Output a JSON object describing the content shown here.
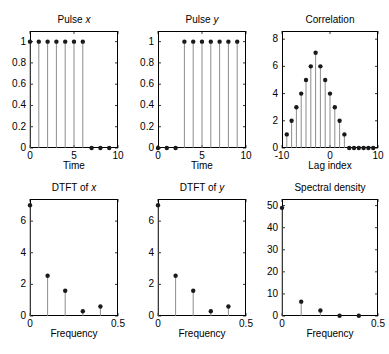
{
  "figure": {
    "background": "#ffffff",
    "stem_color": "#808080",
    "marker_color": "#1a1a1a",
    "axis_color": "#000000",
    "width": 389,
    "height": 354
  },
  "panels": [
    {
      "name": "pulse-x",
      "title_main": "Pulse ",
      "title_italic": "x",
      "xlabel": "Time"
    },
    {
      "name": "pulse-y",
      "title_main": "Pulse ",
      "title_italic": "y",
      "xlabel": "Time"
    },
    {
      "name": "correlation",
      "title_main": "Correlation",
      "title_italic": "",
      "xlabel": "Lag index"
    },
    {
      "name": "dtft-x",
      "title_main": "DTFT of ",
      "title_italic": "x",
      "xlabel": "Frequency"
    },
    {
      "name": "dtft-y",
      "title_main": "DTFT of ",
      "title_italic": "y",
      "xlabel": "Frequency"
    },
    {
      "name": "spectral-density",
      "title_main": "Spectral density",
      "title_italic": "",
      "xlabel": "Frequency"
    }
  ],
  "chart_data": [
    {
      "type": "stem",
      "name": "pulse-x",
      "title": "Pulse x",
      "xlabel": "Time",
      "ylabel": "",
      "xlim": [
        0,
        10
      ],
      "ylim": [
        0,
        1.1
      ],
      "xticks": [
        0,
        5,
        10
      ],
      "xticklabels": [
        "0",
        "5",
        "10"
      ],
      "yticks": [
        0,
        0.2,
        0.4,
        0.6,
        0.8,
        1
      ],
      "yticklabels": [
        "0",
        "0.2",
        "0.4",
        "0.6",
        "0.8",
        "1"
      ],
      "grid": false,
      "legend": "none",
      "x": [
        0,
        1,
        2,
        3,
        4,
        5,
        6,
        7,
        8,
        9
      ],
      "values": [
        1,
        1,
        1,
        1,
        1,
        1,
        1,
        0,
        0,
        0
      ]
    },
    {
      "type": "stem",
      "name": "pulse-y",
      "title": "Pulse y",
      "xlabel": "Time",
      "ylabel": "",
      "xlim": [
        0,
        10
      ],
      "ylim": [
        0,
        1.1
      ],
      "xticks": [
        0,
        5,
        10
      ],
      "xticklabels": [
        "0",
        "5",
        "10"
      ],
      "yticks": [
        0,
        0.2,
        0.4,
        0.6,
        0.8,
        1
      ],
      "yticklabels": [
        "0",
        "0.2",
        "0.4",
        "0.6",
        "0.8",
        "1"
      ],
      "grid": false,
      "legend": "none",
      "x": [
        0,
        1,
        2,
        3,
        4,
        5,
        6,
        7,
        8,
        9
      ],
      "values": [
        0,
        0,
        0,
        1,
        1,
        1,
        1,
        1,
        1,
        1
      ]
    },
    {
      "type": "stem",
      "name": "correlation",
      "title": "Correlation",
      "xlabel": "Lag index",
      "ylabel": "",
      "xlim": [
        -10,
        10
      ],
      "ylim": [
        0,
        8.6
      ],
      "xticks": [
        -10,
        0,
        10
      ],
      "xticklabels": [
        "-10",
        "0",
        "10"
      ],
      "yticks": [
        0,
        2,
        4,
        6,
        8
      ],
      "yticklabels": [
        "0",
        "2",
        "4",
        "6",
        "8"
      ],
      "grid": false,
      "legend": "none",
      "x": [
        -9,
        -8,
        -7,
        -6,
        -5,
        -4,
        -3,
        -2,
        -1,
        0,
        1,
        2,
        3,
        4,
        5,
        6,
        7,
        8,
        9
      ],
      "values": [
        1,
        2,
        3,
        4,
        5,
        6,
        7,
        6,
        5,
        4,
        3,
        2,
        1,
        0,
        0,
        0,
        0,
        0,
        0
      ]
    },
    {
      "type": "stem",
      "name": "dtft-x",
      "title": "DTFT of x",
      "xlabel": "Frequency",
      "ylabel": "",
      "xlim": [
        0,
        0.5
      ],
      "ylim": [
        0,
        7.4
      ],
      "xticks": [
        0,
        0.5
      ],
      "xticklabels": [
        "0",
        "0.5"
      ],
      "yticks": [
        0,
        2,
        4,
        6
      ],
      "yticklabels": [
        "0",
        "2",
        "4",
        "6"
      ],
      "grid": false,
      "legend": "none",
      "x": [
        0,
        0.1,
        0.2,
        0.3,
        0.4
      ],
      "values": [
        7,
        2.55,
        1.6,
        0.3,
        0.6
      ]
    },
    {
      "type": "stem",
      "name": "dtft-y",
      "title": "DTFT of y",
      "xlabel": "Frequency",
      "ylabel": "",
      "xlim": [
        0,
        0.5
      ],
      "ylim": [
        0,
        7.4
      ],
      "xticks": [
        0,
        0.5
      ],
      "xticklabels": [
        "0",
        "0.5"
      ],
      "yticks": [
        0,
        2,
        4,
        6
      ],
      "yticklabels": [
        "0",
        "2",
        "4",
        "6"
      ],
      "grid": false,
      "legend": "none",
      "x": [
        0,
        0.1,
        0.2,
        0.3,
        0.4
      ],
      "values": [
        7,
        2.55,
        1.6,
        0.3,
        0.6
      ]
    },
    {
      "type": "stem",
      "name": "spectral-density",
      "title": "Spectral density",
      "xlabel": "Frequency",
      "ylabel": "",
      "xlim": [
        0,
        0.5
      ],
      "ylim": [
        0,
        53
      ],
      "xticks": [
        0,
        0.5
      ],
      "xticklabels": [
        "0",
        "0.5"
      ],
      "yticks": [
        0,
        10,
        20,
        30,
        40,
        50
      ],
      "yticklabels": [
        "0",
        "10",
        "20",
        "30",
        "40",
        "50"
      ],
      "grid": false,
      "legend": "none",
      "x": [
        0,
        0.1,
        0.2,
        0.3,
        0.4
      ],
      "values": [
        49,
        6.5,
        2.5,
        0.1,
        0.1
      ]
    }
  ]
}
